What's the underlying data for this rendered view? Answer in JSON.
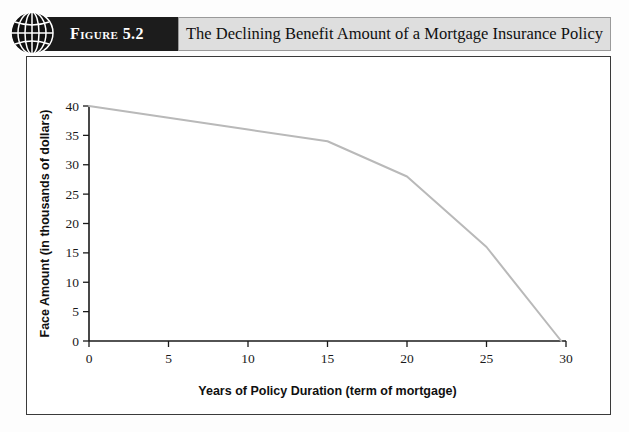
{
  "figure": {
    "label": "Figure 5.2",
    "title": "The Declining Benefit Amount of a Mortgage Insurance Policy",
    "icon": "globe-icon"
  },
  "colors": {
    "tab_dark": "#1c1c1c",
    "tab_light": "#dedede",
    "frame_border": "#3a3a3a",
    "line": "#b9b9b9",
    "axis": "#1a1a1a"
  },
  "chart_data": {
    "type": "line",
    "title": "The Declining Benefit Amount of a Mortgage Insurance Policy",
    "xlabel": "Years of Policy Duration (term of mortgage)",
    "ylabel": "Face Amount (in thousands of dollars)",
    "xlim": [
      0,
      30
    ],
    "ylim": [
      0,
      40
    ],
    "xticks": [
      0,
      5,
      10,
      15,
      20,
      25,
      30
    ],
    "yticks": [
      0,
      5,
      10,
      15,
      20,
      25,
      30,
      35,
      40
    ],
    "xtick_labels": [
      "0",
      "5",
      "10",
      "15",
      "20",
      "25",
      "30"
    ],
    "ytick_labels": [
      "0",
      "5",
      "10",
      "15",
      "20",
      "25",
      "30",
      "35",
      "40"
    ],
    "grid": false,
    "legend": false,
    "series": [
      {
        "name": "Face Amount",
        "x": [
          0,
          5,
          10,
          15,
          20,
          25,
          29.7
        ],
        "values": [
          40,
          38,
          36,
          34,
          28,
          16,
          0
        ]
      }
    ]
  }
}
